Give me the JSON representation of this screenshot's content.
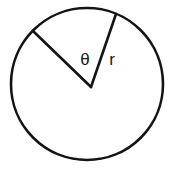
{
  "figure": {
    "kind": "geometry-diagram",
    "background_color": "#ffffff",
    "stroke_color": "#141414",
    "fill_color": "#ffffff",
    "stroke_width": 2.6
  },
  "circle": {
    "name": "circle-outline",
    "center_x": 87,
    "center_y": 84,
    "radius": 76
  },
  "vertex": {
    "name": "angle-vertex",
    "x": 91,
    "y": 87
  },
  "radii": [
    {
      "id": "radius-left",
      "label": "",
      "from_x": 91,
      "from_y": 87,
      "to_x": 33,
      "to_y": 31
    },
    {
      "id": "radius-right",
      "label": "r",
      "from_x": 91,
      "from_y": 87,
      "to_x": 116,
      "to_y": 14
    }
  ],
  "labels": {
    "angle": {
      "text": "θ",
      "x": 85,
      "y": 61,
      "font_size": 17
    },
    "radius": {
      "text": "r",
      "x": 112,
      "y": 61,
      "font_size": 17
    }
  }
}
